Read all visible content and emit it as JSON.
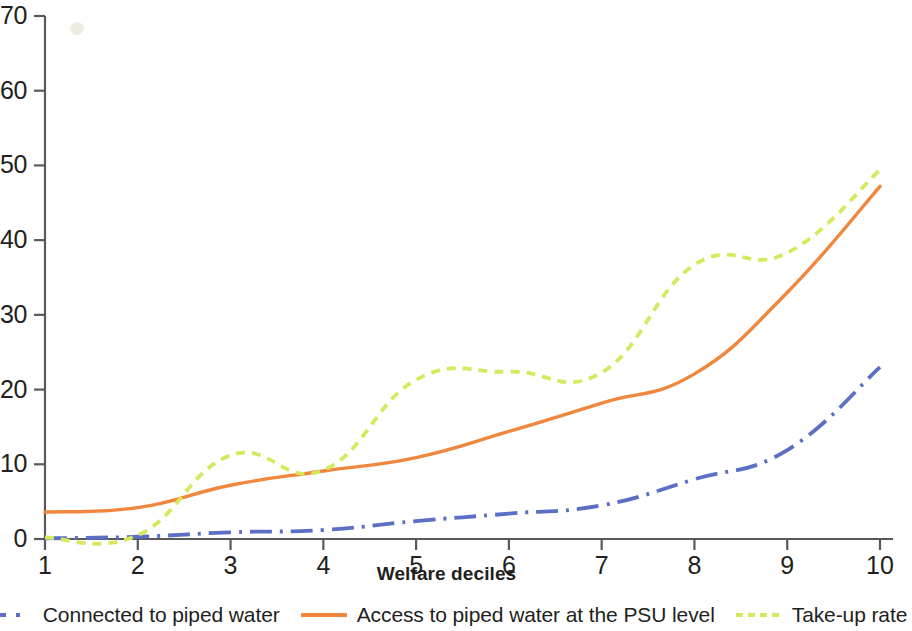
{
  "chart_data": {
    "type": "line",
    "title": "",
    "xlabel": "Welfare deciles",
    "ylabel": "",
    "x": [
      1,
      2,
      3,
      4,
      5,
      6,
      7,
      8,
      9,
      10
    ],
    "categories": [
      "1",
      "2",
      "3",
      "4",
      "5",
      "6",
      "7",
      "8",
      "9",
      "10"
    ],
    "xlim": [
      1,
      10
    ],
    "ylim": [
      0,
      70
    ],
    "grid": false,
    "legend_position": "bottom",
    "xticks": [
      "1",
      "2",
      "3",
      "4",
      "5",
      "6",
      "7",
      "8",
      "9",
      "10"
    ],
    "yticks": [
      "0",
      "10",
      "20",
      "30",
      "40",
      "50",
      "60",
      "70"
    ],
    "ytick_values": [
      0,
      10,
      20,
      30,
      40,
      50,
      60,
      70
    ],
    "series": [
      {
        "name": "Connected to piped water",
        "color": "#5b6fc4",
        "style": "dashdot",
        "values": [
          0.1,
          0.3,
          0.9,
          1.2,
          2.4,
          3.4,
          4.5,
          8.0,
          11.9,
          23.0
        ]
      },
      {
        "name": "Access to piped water at the PSU level",
        "color": "#f0873f",
        "style": "solid",
        "values": [
          3.6,
          4.2,
          7.2,
          9.1,
          10.9,
          14.4,
          18.2,
          22.1,
          33.0,
          47.2
        ]
      },
      {
        "name": "Take-up rate",
        "color": "#d8e85e",
        "style": "dashed",
        "values": [
          0.2,
          0.5,
          11.2,
          9.2,
          21.3,
          22.4,
          22.3,
          36.7,
          38.3,
          49.4
        ]
      }
    ]
  },
  "axis": {
    "x_title": "Welfare deciles"
  },
  "legend": {
    "items": [
      {
        "label": "Connected to piped water",
        "color": "#5b6fc4",
        "style": "dashdot"
      },
      {
        "label": "Access to piped water at the PSU level",
        "color": "#f0873f",
        "style": "solid"
      },
      {
        "label": "Take-up rate",
        "color": "#d8e85e",
        "style": "dashed"
      }
    ]
  }
}
